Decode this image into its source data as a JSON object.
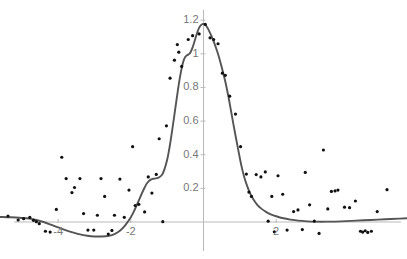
{
  "chart_data": {
    "type": "scatter",
    "title": "",
    "xlabel": "",
    "ylabel": "",
    "xlim": [
      -5.6,
      5.6
    ],
    "ylim": [
      -0.22,
      1.32
    ],
    "grid": false,
    "legend": null,
    "axes": {
      "x_axis_at_y": 0,
      "y_axis_at_x": 0,
      "x_ticks": [
        -4,
        -2,
        2
      ],
      "x_tick_labels": [
        "-4",
        "-2",
        "2"
      ],
      "y_ticks": [
        0.2,
        0.4,
        0.6,
        0.8,
        1,
        1.2
      ],
      "y_tick_labels": [
        "0.2",
        "0.4",
        "0.6",
        "0.8",
        "1",
        "1.2"
      ],
      "axis_color": "#b9b9b9",
      "tick_label_color": "#777777"
    },
    "series": [
      {
        "name": "data",
        "type": "scatter",
        "marker": "circle",
        "marker_color": "#111111",
        "marker_size": 3.2,
        "points": [
          [
            -5.38,
            0.035
          ],
          [
            -5.1,
            0.012
          ],
          [
            -4.95,
            0.02
          ],
          [
            -4.78,
            0.028
          ],
          [
            -4.68,
            0.01
          ],
          [
            -4.6,
            0.002
          ],
          [
            -4.52,
            -0.01
          ],
          [
            -4.35,
            -0.055
          ],
          [
            -4.22,
            -0.06
          ],
          [
            -4.05,
            0.075
          ],
          [
            -3.9,
            0.385
          ],
          [
            -3.78,
            0.258
          ],
          [
            -3.62,
            0.175
          ],
          [
            -3.55,
            0.205
          ],
          [
            -3.4,
            0.258
          ],
          [
            -3.3,
            0.05
          ],
          [
            -3.18,
            -0.048
          ],
          [
            -3.02,
            -0.048
          ],
          [
            -2.92,
            0.04
          ],
          [
            -2.82,
            0.258
          ],
          [
            -2.72,
            0.152
          ],
          [
            -2.62,
            -0.072
          ],
          [
            -2.52,
            -0.05
          ],
          [
            -2.45,
            0.04
          ],
          [
            -2.3,
            0.255
          ],
          [
            -2.18,
            0.028
          ],
          [
            -2.05,
            0.19
          ],
          [
            -1.95,
            0.448
          ],
          [
            -1.88,
            0.098
          ],
          [
            -1.78,
            0.105
          ],
          [
            -1.62,
            0.06
          ],
          [
            -1.52,
            0.268
          ],
          [
            -1.42,
            0.172
          ],
          [
            -1.3,
            0.283
          ],
          [
            -1.22,
            0.495
          ],
          [
            -1.12,
            0.002
          ],
          [
            -1.02,
            0.572
          ],
          [
            -0.92,
            0.855
          ],
          [
            -0.8,
            0.962
          ],
          [
            -0.72,
            1.055
          ],
          [
            -0.68,
            1.01
          ],
          [
            -0.6,
            0.925
          ],
          [
            -0.42,
            1.085
          ],
          [
            -0.3,
            1.108
          ],
          [
            -0.12,
            1.118
          ],
          [
            0.05,
            1.175
          ],
          [
            0.18,
            1.095
          ],
          [
            0.28,
            1.085
          ],
          [
            0.4,
            1.06
          ],
          [
            0.52,
            0.885
          ],
          [
            0.6,
            0.872
          ],
          [
            0.72,
            0.748
          ],
          [
            0.88,
            0.642
          ],
          [
            1.02,
            0.448
          ],
          [
            1.18,
            0.285
          ],
          [
            1.25,
            0.178
          ],
          [
            1.32,
            0.152
          ],
          [
            1.45,
            0.282
          ],
          [
            1.58,
            0.268
          ],
          [
            1.7,
            0.298
          ],
          [
            1.78,
            0.005
          ],
          [
            1.88,
            0.152
          ],
          [
            1.95,
            -0.058
          ],
          [
            2.05,
            0.275
          ],
          [
            2.18,
            0.165
          ],
          [
            2.3,
            -0.048
          ],
          [
            2.48,
            0.062
          ],
          [
            2.6,
            0.072
          ],
          [
            2.72,
            -0.045
          ],
          [
            2.8,
            0.295
          ],
          [
            2.92,
            0.102
          ],
          [
            3.05,
            0.005
          ],
          [
            3.18,
            -0.068
          ],
          [
            3.3,
            0.428
          ],
          [
            3.42,
            0.078
          ],
          [
            3.52,
            0.182
          ],
          [
            3.62,
            0.185
          ],
          [
            3.7,
            0.19
          ],
          [
            3.88,
            0.088
          ],
          [
            4.02,
            0.085
          ],
          [
            4.18,
            0.125
          ],
          [
            4.32,
            -0.055
          ],
          [
            4.38,
            -0.06
          ],
          [
            4.45,
            -0.052
          ],
          [
            4.52,
            -0.062
          ],
          [
            4.62,
            -0.055
          ],
          [
            4.78,
            0.062
          ],
          [
            5.05,
            0.192
          ]
        ]
      },
      {
        "name": "fit",
        "type": "line",
        "line_color": "#555555",
        "line_width": 1.9,
        "points": [
          [
            -5.6,
            0.03
          ],
          [
            -5.3,
            0.028
          ],
          [
            -5.0,
            0.024
          ],
          [
            -4.8,
            0.02
          ],
          [
            -4.6,
            0.012
          ],
          [
            -4.4,
            0.0
          ],
          [
            -4.2,
            -0.016
          ],
          [
            -4.0,
            -0.032
          ],
          [
            -3.8,
            -0.048
          ],
          [
            -3.6,
            -0.062
          ],
          [
            -3.4,
            -0.074
          ],
          [
            -3.2,
            -0.082
          ],
          [
            -3.0,
            -0.086
          ],
          [
            -2.8,
            -0.086
          ],
          [
            -2.6,
            -0.082
          ],
          [
            -2.45,
            -0.072
          ],
          [
            -2.3,
            -0.052
          ],
          [
            -2.15,
            -0.018
          ],
          [
            -2.0,
            0.028
          ],
          [
            -1.9,
            0.07
          ],
          [
            -1.8,
            0.118
          ],
          [
            -1.7,
            0.168
          ],
          [
            -1.62,
            0.205
          ],
          [
            -1.55,
            0.232
          ],
          [
            -1.45,
            0.252
          ],
          [
            -1.35,
            0.258
          ],
          [
            -1.25,
            0.262
          ],
          [
            -1.15,
            0.278
          ],
          [
            -1.08,
            0.31
          ],
          [
            -1.0,
            0.37
          ],
          [
            -0.95,
            0.425
          ],
          [
            -0.9,
            0.49
          ],
          [
            -0.85,
            0.562
          ],
          [
            -0.8,
            0.638
          ],
          [
            -0.75,
            0.715
          ],
          [
            -0.7,
            0.79
          ],
          [
            -0.65,
            0.858
          ],
          [
            -0.6,
            0.915
          ],
          [
            -0.55,
            0.958
          ],
          [
            -0.5,
            0.982
          ],
          [
            -0.45,
            0.992
          ],
          [
            -0.4,
            0.998
          ],
          [
            -0.35,
            1.012
          ],
          [
            -0.3,
            1.038
          ],
          [
            -0.25,
            1.072
          ],
          [
            -0.2,
            1.108
          ],
          [
            -0.15,
            1.14
          ],
          [
            -0.1,
            1.162
          ],
          [
            -0.05,
            1.174
          ],
          [
            0.0,
            1.178
          ],
          [
            0.05,
            1.172
          ],
          [
            0.1,
            1.158
          ],
          [
            0.15,
            1.138
          ],
          [
            0.22,
            1.105
          ],
          [
            0.3,
            1.062
          ],
          [
            0.38,
            1.012
          ],
          [
            0.45,
            0.962
          ],
          [
            0.52,
            0.905
          ],
          [
            0.6,
            0.835
          ],
          [
            0.68,
            0.752
          ],
          [
            0.75,
            0.67
          ],
          [
            0.82,
            0.585
          ],
          [
            0.9,
            0.492
          ],
          [
            0.98,
            0.402
          ],
          [
            1.05,
            0.328
          ],
          [
            1.12,
            0.268
          ],
          [
            1.2,
            0.215
          ],
          [
            1.28,
            0.172
          ],
          [
            1.38,
            0.132
          ],
          [
            1.48,
            0.102
          ],
          [
            1.6,
            0.078
          ],
          [
            1.72,
            0.06
          ],
          [
            1.85,
            0.046
          ],
          [
            2.0,
            0.034
          ],
          [
            2.2,
            0.022
          ],
          [
            2.4,
            0.014
          ],
          [
            2.6,
            0.008
          ],
          [
            2.85,
            0.004
          ],
          [
            3.1,
            0.002
          ],
          [
            3.4,
            0.002
          ],
          [
            3.8,
            0.004
          ],
          [
            4.2,
            0.008
          ],
          [
            4.6,
            0.012
          ],
          [
            5.0,
            0.016
          ],
          [
            5.4,
            0.02
          ],
          [
            5.6,
            0.022
          ]
        ]
      }
    ]
  }
}
